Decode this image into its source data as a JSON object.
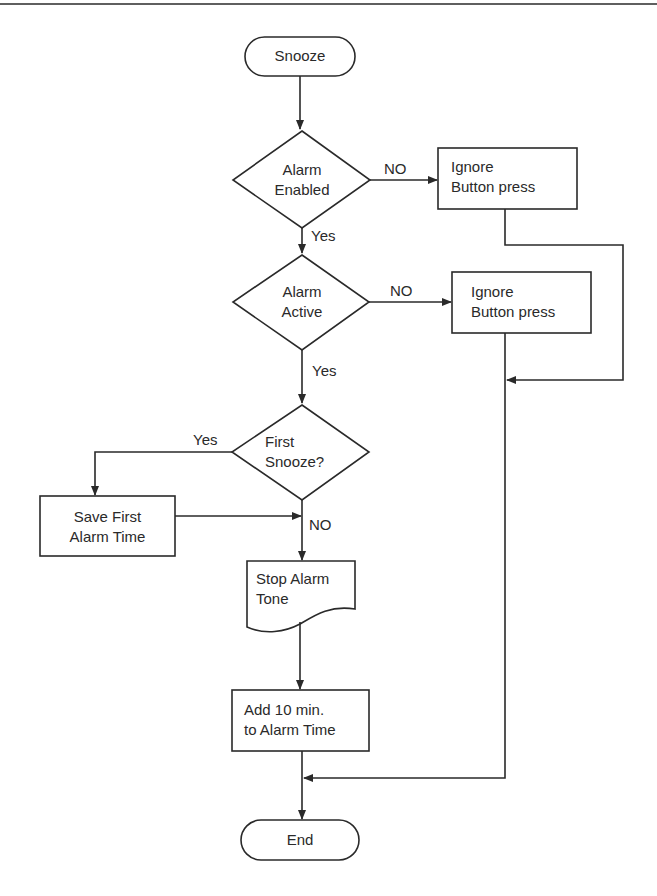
{
  "diagram": {
    "type": "flowchart",
    "nodes": {
      "start": {
        "shape": "terminator",
        "text": "Snooze"
      },
      "alarm_enabled": {
        "shape": "decision",
        "line1": "Alarm",
        "line2": "Enabled"
      },
      "ignore_1": {
        "shape": "process",
        "line1": "Ignore",
        "line2": "Button press"
      },
      "alarm_active": {
        "shape": "decision",
        "line1": "Alarm",
        "line2": "Active"
      },
      "ignore_2": {
        "shape": "process",
        "line1": "Ignore",
        "line2": "Button press"
      },
      "first_snooze": {
        "shape": "decision",
        "line1": "First",
        "line2": "Snooze?"
      },
      "save_first": {
        "shape": "process",
        "line1": "Save First",
        "line2": "Alarm Time"
      },
      "stop_tone": {
        "shape": "document",
        "line1": "Stop Alarm",
        "line2": "Tone"
      },
      "add_ten": {
        "shape": "process",
        "line1": "Add 10 min.",
        "line2": "to Alarm Time"
      },
      "end": {
        "shape": "terminator",
        "text": "End"
      }
    },
    "edge_labels": {
      "enabled_no": "NO",
      "enabled_yes": "Yes",
      "active_no": "NO",
      "active_yes": "Yes",
      "first_yes": "Yes",
      "first_no": "NO"
    },
    "edges": [
      {
        "from": "start",
        "to": "alarm_enabled"
      },
      {
        "from": "alarm_enabled",
        "to": "ignore_1",
        "label": "NO"
      },
      {
        "from": "alarm_enabled",
        "to": "alarm_active",
        "label": "Yes"
      },
      {
        "from": "alarm_active",
        "to": "ignore_2",
        "label": "NO"
      },
      {
        "from": "alarm_active",
        "to": "first_snooze",
        "label": "Yes"
      },
      {
        "from": "first_snooze",
        "to": "save_first",
        "label": "Yes"
      },
      {
        "from": "first_snooze",
        "to": "stop_tone",
        "label": "NO"
      },
      {
        "from": "save_first",
        "to": "stop_tone"
      },
      {
        "from": "ignore_1",
        "to": "end"
      },
      {
        "from": "ignore_2",
        "to": "end"
      },
      {
        "from": "stop_tone",
        "to": "add_ten"
      },
      {
        "from": "add_ten",
        "to": "end"
      }
    ],
    "colors": {
      "stroke": "#2a2a2a",
      "background": "#ffffff",
      "text": "#2a2a2a"
    }
  }
}
